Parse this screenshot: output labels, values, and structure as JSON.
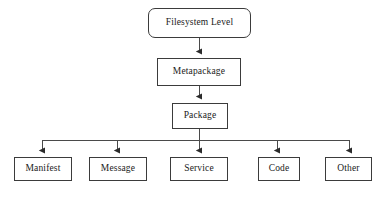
{
  "figure": {
    "type": "hierarchy-tree-diagram",
    "background_color": "#ffffff",
    "stroke_color": "#3b3b3b",
    "text_color": "#1a1a1a",
    "caption": "",
    "levels": [
      {
        "level": 1,
        "nodes": [
          {
            "id": "filesystem-level",
            "label": "Filesystem Level",
            "shape": "rounded-rect",
            "x": 148,
            "y": 8,
            "w": 103,
            "h": 30
          }
        ]
      },
      {
        "level": 2,
        "nodes": [
          {
            "id": "metapackage",
            "label": "Metapackage",
            "shape": "rect",
            "x": 157,
            "y": 58,
            "w": 84,
            "h": 28
          }
        ]
      },
      {
        "level": 3,
        "nodes": [
          {
            "id": "package",
            "label": "Package",
            "shape": "rect",
            "x": 172,
            "y": 103,
            "w": 56,
            "h": 26
          }
        ]
      },
      {
        "level": 4,
        "nodes": [
          {
            "id": "manifest",
            "label": "Manifest",
            "shape": "rect",
            "x": 14,
            "y": 157,
            "w": 58,
            "h": 24
          },
          {
            "id": "message",
            "label": "Message",
            "shape": "rect",
            "x": 89,
            "y": 157,
            "w": 58,
            "h": 24
          },
          {
            "id": "service",
            "label": "Service",
            "shape": "rect",
            "x": 170,
            "y": 157,
            "w": 58,
            "h": 24
          },
          {
            "id": "code",
            "label": "Code",
            "shape": "rect",
            "x": 258,
            "y": 157,
            "w": 42,
            "h": 24
          },
          {
            "id": "other",
            "label": "Other",
            "shape": "rect",
            "x": 325,
            "y": 157,
            "w": 47,
            "h": 24
          }
        ]
      }
    ],
    "connectors": {
      "trunk_x": 199,
      "bus_y": 140,
      "bus_x_start": 42,
      "bus_x_end": 349,
      "branch_x": [
        42,
        117,
        199,
        277,
        349
      ],
      "arrows": [
        {
          "from": "filesystem-level",
          "to": "metapackage"
        },
        {
          "from": "metapackage",
          "to": "package"
        },
        {
          "from": "package",
          "to": "manifest"
        },
        {
          "from": "package",
          "to": "message"
        },
        {
          "from": "package",
          "to": "service"
        },
        {
          "from": "package",
          "to": "code"
        },
        {
          "from": "package",
          "to": "other"
        }
      ]
    }
  }
}
